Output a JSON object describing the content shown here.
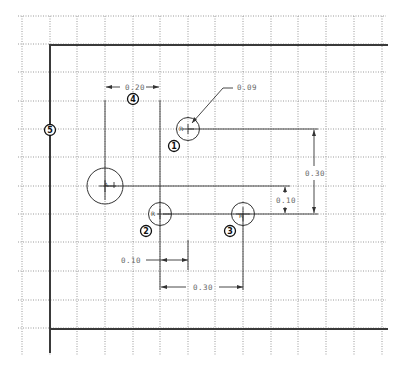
{
  "drawing": {
    "units": "in",
    "grid": {
      "visible": true,
      "style": "dotted"
    },
    "holes": [
      {
        "id": 1,
        "label": "R",
        "callout": "1",
        "diameter_note": "0.09"
      },
      {
        "id": 2,
        "label": "R",
        "callout": "2"
      },
      {
        "id": 3,
        "label": "R",
        "callout": "3"
      },
      {
        "id": "large",
        "label": "A"
      }
    ],
    "dimensions": {
      "horizontal_top": "0.20",
      "leader": "0.09",
      "vertical_right_long": "0.30",
      "vertical_right_short": "0.10",
      "horizontal_bottom_short": "0.10",
      "horizontal_bottom_long": "0.30"
    },
    "callouts": {
      "c1": "1",
      "c2": "2",
      "c3": "3",
      "c4": "4",
      "c5": "5"
    },
    "colors": {
      "border": "#3a3a3a",
      "grid": "#9a9a9a",
      "dimension_text": "#666666",
      "callout": "#111111"
    }
  }
}
